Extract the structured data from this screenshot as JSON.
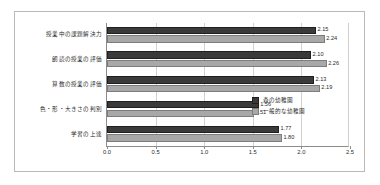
{
  "chart_data": {
    "type": "bar",
    "orientation": "horizontal",
    "title": "",
    "xlabel": "",
    "ylabel": "",
    "xlim": [
      0.0,
      2.5
    ],
    "xticks": [
      "0.0",
      "0.5",
      "1.0",
      "1.5",
      "2.0",
      "2.5"
    ],
    "grid": true,
    "legend_position": "inside-lower-right",
    "categories": [
      "授業中の課題解決力",
      "朗読の授業の評価",
      "算数の授業の評価",
      "色・形・大きさの判別",
      "学習の上達"
    ],
    "series": [
      {
        "name": "森の幼稚園",
        "color": "#3a3a3a",
        "values": [
          2.15,
          2.1,
          2.13,
          1.56,
          1.77
        ],
        "labels": [
          "2.15",
          "2.10",
          "2.13",
          "1.56",
          "1.77"
        ]
      },
      {
        "name": "一般的な幼稚園",
        "color": "#a8a8a8",
        "values": [
          2.24,
          2.26,
          2.19,
          1.51,
          1.8
        ],
        "labels": [
          "2.24",
          "2.26",
          "2.19",
          "1.51",
          "1.80"
        ]
      }
    ]
  }
}
